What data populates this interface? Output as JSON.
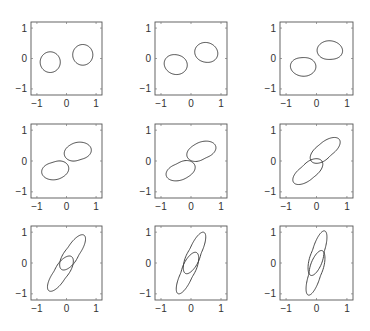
{
  "chart_data": {
    "type": "line",
    "title": "",
    "layout": {
      "rows": 3,
      "cols": 3,
      "grid": false,
      "legend": "none"
    },
    "xlim": [
      -1.2,
      1.2
    ],
    "ylim": [
      -1.2,
      1.2
    ],
    "xticks": [
      -1,
      0,
      1
    ],
    "yticks": [
      -1,
      0,
      1
    ],
    "xtick_labels": [
      "−1",
      "0",
      "1"
    ],
    "ytick_labels": [
      "−1",
      "0",
      "1"
    ],
    "xlabel": "",
    "ylabel": "",
    "line_color": "#333333",
    "axes_color": "#555555",
    "panels": [
      {
        "index": 1,
        "description": "two separate circles",
        "lobes": [
          {
            "shape": "ellipse",
            "cx": 0.55,
            "cy": 0.12,
            "rx": 0.34,
            "ry": 0.34,
            "rot": 0,
            "pinch": 0
          },
          {
            "shape": "ellipse",
            "cx": -0.55,
            "cy": -0.12,
            "rx": 0.34,
            "ry": 0.34,
            "rot": 0,
            "pinch": 0
          }
        ]
      },
      {
        "index": 2,
        "description": "two slightly oval blobs",
        "lobes": [
          {
            "shape": "ellipse",
            "cx": 0.52,
            "cy": 0.2,
            "rx": 0.38,
            "ry": 0.32,
            "rot": -20,
            "pinch": 0.08
          },
          {
            "shape": "ellipse",
            "cx": -0.52,
            "cy": -0.2,
            "rx": 0.38,
            "ry": 0.32,
            "rot": -20,
            "pinch": 0.08
          }
        ]
      },
      {
        "index": 3,
        "description": "egg-shaped blobs approaching",
        "lobes": [
          {
            "shape": "ellipse",
            "cx": 0.46,
            "cy": 0.28,
            "rx": 0.4,
            "ry": 0.3,
            "rot": -10,
            "pinch": 0.18
          },
          {
            "shape": "ellipse",
            "cx": -0.46,
            "cy": -0.28,
            "rx": 0.4,
            "ry": 0.3,
            "rot": -10,
            "pinch": 0.18
          }
        ]
      },
      {
        "index": 4,
        "description": "teardrop blobs",
        "lobes": [
          {
            "shape": "ellipse",
            "cx": 0.42,
            "cy": 0.33,
            "rx": 0.42,
            "ry": 0.28,
            "rot": 5,
            "pinch": 0.3
          },
          {
            "shape": "ellipse",
            "cx": -0.42,
            "cy": -0.33,
            "rx": 0.42,
            "ry": 0.28,
            "rot": 5,
            "pinch": 0.3
          }
        ]
      },
      {
        "index": 5,
        "description": "teardrops nearly touching",
        "lobes": [
          {
            "shape": "ellipse",
            "cx": 0.4,
            "cy": 0.36,
            "rx": 0.44,
            "ry": 0.27,
            "rot": 15,
            "pinch": 0.38
          },
          {
            "shape": "ellipse",
            "cx": -0.4,
            "cy": -0.36,
            "rx": 0.44,
            "ry": 0.27,
            "rot": 15,
            "pinch": 0.38
          }
        ]
      },
      {
        "index": 6,
        "description": "lobes touching at origin",
        "lobes": [
          {
            "shape": "ellipse",
            "cx": 0.36,
            "cy": 0.42,
            "rx": 0.48,
            "ry": 0.25,
            "rot": 35,
            "pinch": 0.45
          },
          {
            "shape": "ellipse",
            "cx": -0.36,
            "cy": -0.42,
            "rx": 0.48,
            "ry": 0.25,
            "rot": 35,
            "pinch": 0.45
          }
        ]
      },
      {
        "index": 7,
        "description": "overlapping elongated lobes",
        "lobes": [
          {
            "shape": "ellipse",
            "cx": 0.28,
            "cy": 0.45,
            "rx": 0.55,
            "ry": 0.22,
            "rot": 55,
            "pinch": 0.45
          },
          {
            "shape": "ellipse",
            "cx": -0.28,
            "cy": -0.45,
            "rx": 0.55,
            "ry": 0.22,
            "rot": 55,
            "pinch": 0.45
          }
        ]
      },
      {
        "index": 8,
        "description": "strongly overlapping lobes",
        "lobes": [
          {
            "shape": "ellipse",
            "cx": 0.18,
            "cy": 0.45,
            "rx": 0.6,
            "ry": 0.2,
            "rot": 65,
            "pinch": 0.45
          },
          {
            "shape": "ellipse",
            "cx": -0.18,
            "cy": -0.45,
            "rx": 0.6,
            "ry": 0.2,
            "rot": 65,
            "pinch": 0.45
          }
        ]
      },
      {
        "index": 9,
        "description": "nearly vertical overlapping lobes",
        "lobes": [
          {
            "shape": "ellipse",
            "cx": 0.08,
            "cy": 0.45,
            "rx": 0.62,
            "ry": 0.19,
            "rot": 72,
            "pinch": 0.45
          },
          {
            "shape": "ellipse",
            "cx": -0.08,
            "cy": -0.45,
            "rx": 0.62,
            "ry": 0.19,
            "rot": 72,
            "pinch": 0.45
          }
        ]
      }
    ]
  },
  "figure": {
    "axes_boxes_px": [
      {
        "x": 31,
        "y": 22,
        "w": 71,
        "h": 73
      },
      {
        "x": 155,
        "y": 22,
        "w": 72,
        "h": 73
      },
      {
        "x": 280,
        "y": 22,
        "w": 73,
        "h": 73
      },
      {
        "x": 31,
        "y": 124,
        "w": 71,
        "h": 74
      },
      {
        "x": 155,
        "y": 124,
        "w": 72,
        "h": 74
      },
      {
        "x": 280,
        "y": 124,
        "w": 73,
        "h": 74
      },
      {
        "x": 31,
        "y": 226,
        "w": 71,
        "h": 74
      },
      {
        "x": 155,
        "y": 226,
        "w": 72,
        "h": 74
      },
      {
        "x": 280,
        "y": 226,
        "w": 73,
        "h": 74
      }
    ]
  }
}
